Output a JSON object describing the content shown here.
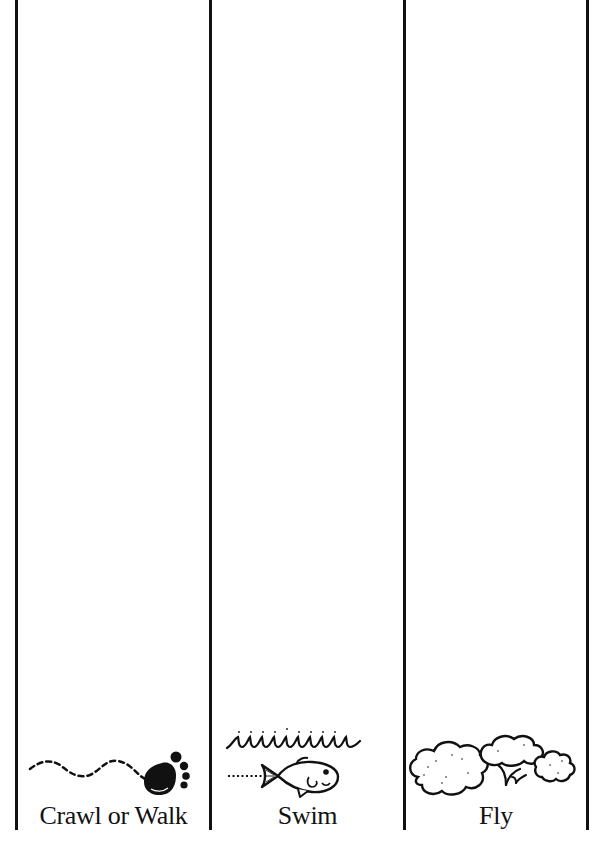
{
  "worksheet": {
    "columns": [
      {
        "label": "Crawl or Walk",
        "icon": "footprint-icon"
      },
      {
        "label": "Swim",
        "icon": "fish-icon"
      },
      {
        "label": "Fly",
        "icon": "clouds-bird-icon"
      }
    ]
  },
  "colors": {
    "ink": "#111111",
    "background": "#ffffff"
  }
}
